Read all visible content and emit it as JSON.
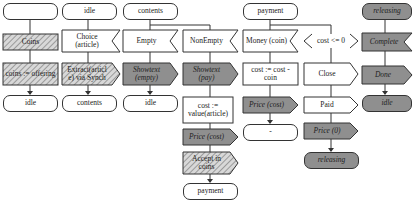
{
  "diagram": {
    "type": "SDL process state machine",
    "colors": {
      "line": "#333333",
      "gray_fill": "#8f8f8f",
      "hatch": "#9a9a9a",
      "background": "#ffffff"
    },
    "columns": [
      {
        "id": "start",
        "nodes": [
          {
            "kind": "start-state",
            "label": ""
          },
          {
            "kind": "task-hatched",
            "label": "Coins"
          },
          {
            "kind": "task-hatched",
            "label": "coins := offering"
          },
          {
            "kind": "state",
            "label": "idle"
          }
        ]
      },
      {
        "id": "idle",
        "nodes": [
          {
            "kind": "state",
            "label": "idle"
          },
          {
            "kind": "input",
            "label": "Choice (article)"
          },
          {
            "kind": "output-hatched",
            "label": "Extract(articl e) via Synch"
          },
          {
            "kind": "state",
            "label": "contents"
          }
        ]
      },
      {
        "id": "contents",
        "nodes": [
          {
            "kind": "state",
            "label": "contents"
          },
          {
            "kind": "input",
            "label": "Empty"
          },
          {
            "kind": "output-gray",
            "label": "Showtext (empty)"
          },
          {
            "kind": "state",
            "label": "idle"
          },
          {
            "kind": "input",
            "label": "NonEmpty"
          },
          {
            "kind": "output-gray",
            "label": "Showtext (pay)"
          },
          {
            "kind": "task",
            "label": "cost := value(article)"
          },
          {
            "kind": "output-gray",
            "label": "Price (cost)"
          },
          {
            "kind": "output-hatched",
            "label": "Accept in coins"
          },
          {
            "kind": "state",
            "label": "payment"
          }
        ]
      },
      {
        "id": "payment",
        "nodes": [
          {
            "kind": "state",
            "label": "payment"
          },
          {
            "kind": "input",
            "label": "Money (coin)"
          },
          {
            "kind": "task",
            "label": "cost := cost - coin"
          },
          {
            "kind": "output-gray",
            "label": "Price (cost)"
          },
          {
            "kind": "state",
            "label": "-"
          },
          {
            "kind": "continuous-signal",
            "label": "cost <= 0"
          },
          {
            "kind": "output",
            "label": "Close"
          },
          {
            "kind": "output",
            "label": "Paid"
          },
          {
            "kind": "output-gray",
            "label": "Price (0)"
          },
          {
            "kind": "state-gray",
            "label": "releasing"
          }
        ]
      },
      {
        "id": "releasing",
        "nodes": [
          {
            "kind": "state-gray",
            "label": "releasing"
          },
          {
            "kind": "input-gray",
            "label": "Complete"
          },
          {
            "kind": "output-gray",
            "label": "Done"
          },
          {
            "kind": "state-gray",
            "label": "idle"
          }
        ]
      }
    ]
  }
}
